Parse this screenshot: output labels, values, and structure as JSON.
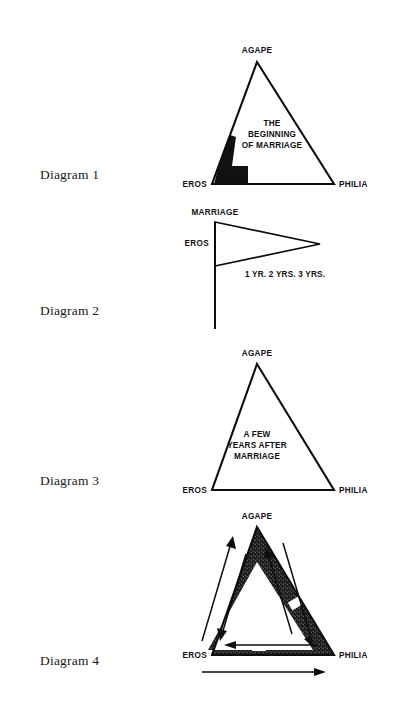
{
  "page": {
    "width": 396,
    "height": 716,
    "background": "#ffffff",
    "ink": "#111111"
  },
  "diagrams": [
    {
      "id": "diagram-1",
      "label": "Diagram 1",
      "vertices": {
        "top": "AGAPE",
        "left": "EROS",
        "right": "PHILIA"
      },
      "inner_text": [
        "THE",
        "BEGINNING",
        "OF MARRIAGE"
      ],
      "shape": "triangle-with-filled-corner"
    },
    {
      "id": "diagram-2",
      "label": "Diagram 2",
      "vertices": {
        "top": "MARRIAGE",
        "left": "EROS"
      },
      "inner_text": [
        "1 YR. 2 YRS. 3 YRS."
      ],
      "shape": "pennant-flag-on-pole"
    },
    {
      "id": "diagram-3",
      "label": "Diagram 3",
      "vertices": {
        "top": "AGAPE",
        "left": "EROS",
        "right": "PHILIA"
      },
      "inner_text": [
        "A FEW",
        "YEARS AFTER",
        "MARRIAGE"
      ],
      "shape": "open-triangle"
    },
    {
      "id": "diagram-4",
      "label": "Diagram 4",
      "vertices": {
        "top": "AGAPE",
        "left": "EROS",
        "right": "PHILIA"
      },
      "inner_text": [],
      "shape": "thick-banded-triangle-with-arrows"
    }
  ]
}
